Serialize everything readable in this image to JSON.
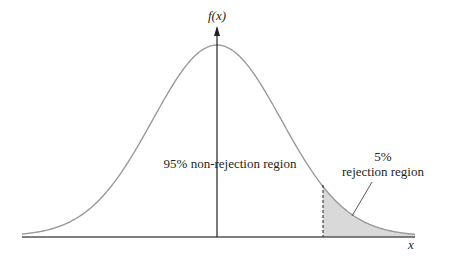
{
  "diagram": {
    "type": "normal-distribution-one-tailed-test",
    "y_axis_label": "f(x)",
    "x_axis_label": "x",
    "non_rejection_label": "95% non-rejection region",
    "rejection_label_line1": "5%",
    "rejection_label_line2": "rejection region",
    "non_rejection_percent": 95,
    "rejection_percent": 5,
    "critical_z": 1.645,
    "colors": {
      "curve": "#9a9a9a",
      "axis": "#555555",
      "shaded_region": "#d9d9d9",
      "text": "#231f20"
    }
  }
}
